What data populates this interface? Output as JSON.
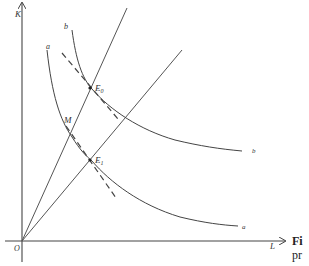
{
  "diagram": {
    "type": "isoquant-diagram",
    "axes": {
      "y_label": "K",
      "x_label": "L",
      "origin_label": "O"
    },
    "curves": [
      {
        "id": "b",
        "label": "b",
        "end_label": "b"
      },
      {
        "id": "a",
        "label": "a",
        "end_label": "a"
      }
    ],
    "rays": [
      {
        "id": "steep-ray"
      },
      {
        "id": "shallow-ray"
      }
    ],
    "points": [
      {
        "id": "E0",
        "label": "E",
        "subscript": "0"
      },
      {
        "id": "E1",
        "label": "E",
        "subscript": "1"
      },
      {
        "id": "M",
        "label": "M"
      }
    ],
    "tangent_lines": [
      {
        "id": "tangent-E0",
        "style": "dashed"
      },
      {
        "id": "tangent-E1",
        "style": "dashed"
      }
    ],
    "colors": {
      "line": "#444444",
      "background": "#ffffff"
    }
  },
  "caption": {
    "fig_fragment": "Fi",
    "text_fragment": "pr"
  }
}
